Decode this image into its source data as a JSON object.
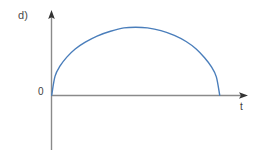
{
  "figure": {
    "panel_label": "d)",
    "background_color": "#ffffff",
    "width": 268,
    "height": 164
  },
  "axes": {
    "origin_label": "0",
    "x_axis_name": "t",
    "y_axis_name": "",
    "axis_color": "#8a8a8a",
    "arrow_color": "#333333",
    "x_axis_y_px": 95,
    "y_axis_x_px": 51,
    "x_axis_start_px": 51,
    "x_axis_end_px": 247,
    "y_axis_top_px": 12,
    "y_axis_bottom_px": 150
  },
  "chart_data": {
    "type": "line",
    "title": "d)",
    "xlabel": "t",
    "ylabel": "",
    "grid": false,
    "legend": false,
    "legend_position": "none",
    "series": [
      {
        "name": "arch",
        "color": "#4a7ebb",
        "line_width": 1.4,
        "description": "Semi-elliptical arch starting at the origin, rising steeply, peaking near the middle, and falling steeply back to the t-axis.",
        "x": [
          0.0,
          0.02,
          0.05,
          0.09,
          0.14,
          0.2,
          0.27,
          0.35,
          0.43,
          0.5,
          0.57,
          0.65,
          0.73,
          0.8,
          0.86,
          0.91,
          0.95,
          0.98,
          1.0
        ],
        "y": [
          0.0,
          0.28,
          0.43,
          0.56,
          0.68,
          0.78,
          0.87,
          0.94,
          0.99,
          1.0,
          0.99,
          0.95,
          0.88,
          0.79,
          0.68,
          0.55,
          0.42,
          0.27,
          0.0
        ]
      }
    ],
    "xlim": [
      0,
      1.175
    ],
    "ylim": [
      0,
      1.1
    ],
    "x_ticks": [
      0
    ],
    "x_tick_labels": [
      "0"
    ],
    "y_ticks": [],
    "y_tick_labels": []
  }
}
